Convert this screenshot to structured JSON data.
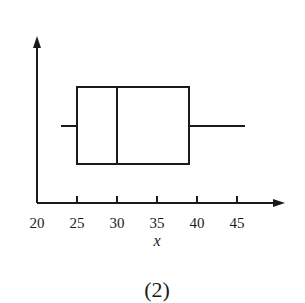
{
  "chart_data": {
    "type": "boxplot",
    "title": "",
    "xlabel": "x",
    "ylabel": "",
    "caption": "(2)",
    "xlim": [
      20,
      50
    ],
    "xticks": [
      20,
      25,
      30,
      35,
      40,
      45
    ],
    "tick_labels": [
      "20",
      "25",
      "30",
      "35",
      "40",
      "45"
    ],
    "grid": false,
    "orientation": "horizontal",
    "box": {
      "min": 23,
      "q1": 25,
      "median": 30,
      "q3": 39,
      "max": 46
    }
  },
  "colors": {
    "stroke": "#1a1a1a",
    "background": "#ffffff"
  }
}
